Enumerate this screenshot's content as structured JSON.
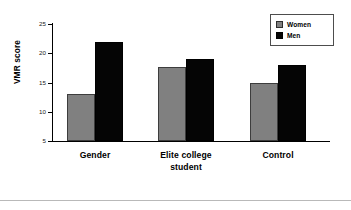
{
  "chart_data": {
    "type": "bar",
    "title": "",
    "subtitle": "",
    "xlabel": "",
    "ylabel": "VMR score",
    "ylim": [
      5,
      25
    ],
    "yticks": [
      5,
      10,
      15,
      20,
      25
    ],
    "ytick_labels": [
      "5",
      "10",
      "15",
      "20",
      "25"
    ],
    "grid": false,
    "legend_position": "top-right",
    "categories": [
      "Gender",
      "Elite college student",
      "Control"
    ],
    "category_lines": [
      [
        "Gender"
      ],
      [
        "Elite college",
        "student"
      ],
      [
        "Control"
      ]
    ],
    "series": [
      {
        "name": "Women",
        "color": "#808080",
        "values": [
          13.0,
          17.7,
          15.0
        ]
      },
      {
        "name": "Men",
        "color": "#000000",
        "values": [
          22.0,
          19.0,
          18.0
        ]
      }
    ]
  },
  "legend": {
    "entries": [
      {
        "label": "Women",
        "swatch": "women-swatch"
      },
      {
        "label": "Men",
        "swatch": "men-swatch"
      }
    ]
  },
  "axis": {
    "y_title": "VMR score",
    "y_tick_labels": [
      "25",
      "20",
      "15",
      "10",
      "5"
    ]
  },
  "colors": {
    "women": "#808080",
    "men": "#000000",
    "axis": "#000000",
    "background": "#ffffff",
    "legend_border": "#4d4d4d",
    "bottom_rule": "#b9b9b9"
  }
}
